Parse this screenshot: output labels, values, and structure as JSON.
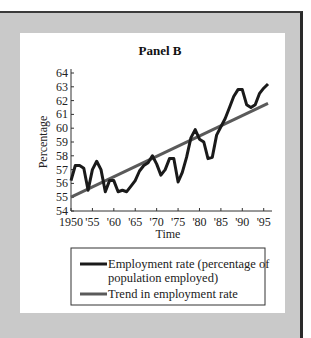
{
  "panel": {
    "title": "Panel B"
  },
  "chart_data": {
    "type": "line",
    "title": "Panel B",
    "xlabel": "Time",
    "ylabel": "Percentage",
    "xlim": [
      1950,
      1996
    ],
    "ylim": [
      54,
      64
    ],
    "grid": false,
    "legend_position": "bottom",
    "x_tick_labels": [
      "1950",
      "'55",
      "'60",
      "'65",
      "'70",
      "'75",
      "'80",
      "'85",
      "'90",
      "'95"
    ],
    "x_ticks": [
      1950,
      1955,
      1960,
      1965,
      1970,
      1975,
      1980,
      1985,
      1990,
      1995
    ],
    "y_ticks": [
      54,
      55,
      56,
      57,
      58,
      59,
      60,
      61,
      62,
      63,
      64
    ],
    "x": [
      1950,
      1951,
      1952,
      1953,
      1954,
      1955,
      1956,
      1957,
      1958,
      1959,
      1960,
      1961,
      1962,
      1963,
      1964,
      1965,
      1966,
      1967,
      1968,
      1969,
      1970,
      1971,
      1972,
      1973,
      1974,
      1975,
      1976,
      1977,
      1978,
      1979,
      1980,
      1981,
      1982,
      1983,
      1984,
      1985,
      1986,
      1987,
      1988,
      1989,
      1990,
      1991,
      1992,
      1993,
      1994,
      1995,
      1996
    ],
    "series": [
      {
        "name": "Employment rate (percentage of population employed)",
        "color": "#1a1a1a",
        "values": [
          56.2,
          57.3,
          57.3,
          57.1,
          55.5,
          57.0,
          57.6,
          57.0,
          55.4,
          56.2,
          56.2,
          55.4,
          55.5,
          55.4,
          55.8,
          56.2,
          56.9,
          57.3,
          57.5,
          58.0,
          57.4,
          56.6,
          57.0,
          57.8,
          57.8,
          56.1,
          56.8,
          57.9,
          59.3,
          59.9,
          59.2,
          59.0,
          57.8,
          57.9,
          59.5,
          60.1,
          60.7,
          61.5,
          62.3,
          62.8,
          62.8,
          61.7,
          61.5,
          61.7,
          62.5,
          62.9,
          63.2
        ]
      },
      {
        "name": "Trend in employment rate",
        "color": "#5a5a5a",
        "x": [
          1950,
          1996
        ],
        "values": [
          55.0,
          61.8
        ]
      }
    ]
  },
  "legend": {
    "items": [
      {
        "line1": "Employment rate (percentage of",
        "line2": "population employed)",
        "color": "#1a1a1a"
      },
      {
        "line1": "Trend in employment rate",
        "color": "#5a5a5a"
      }
    ]
  }
}
